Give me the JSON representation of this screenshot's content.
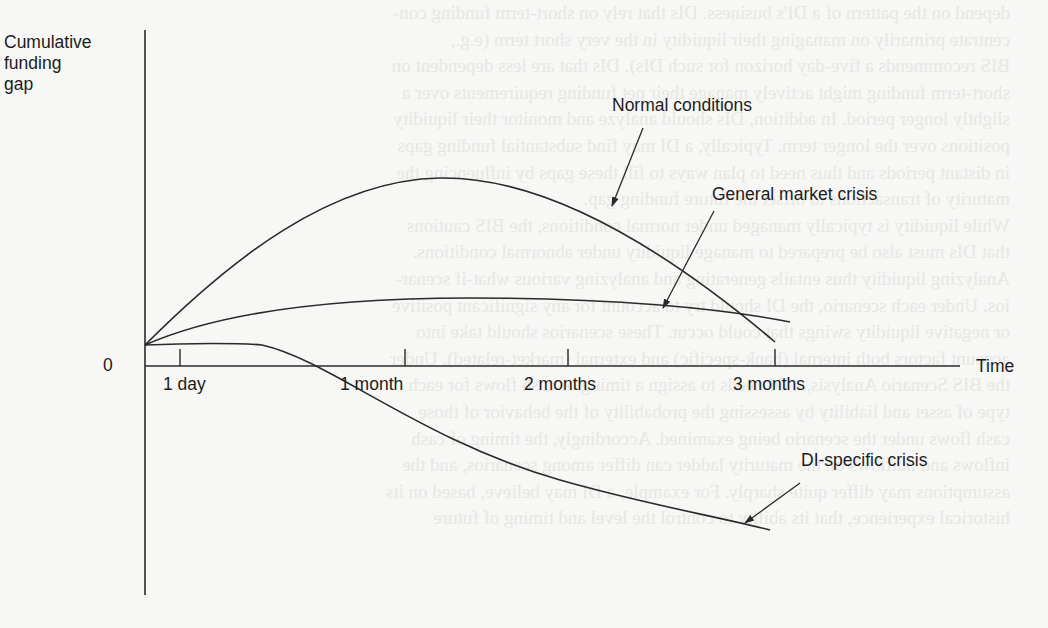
{
  "figure": {
    "y_axis_label": [
      "Cumulative",
      "funding",
      "gap"
    ],
    "x_axis_label": "Time",
    "origin_label": "0",
    "ticks": [
      {
        "label": "1 day",
        "x": 180,
        "label_x": 163
      },
      {
        "label": "1 month",
        "x": 405,
        "label_x": 340
      },
      {
        "label": "2 months",
        "x": 568,
        "label_x": 524
      },
      {
        "label": "3 months",
        "x": 775,
        "label_x": 733
      }
    ],
    "curves": [
      {
        "name": "Normal conditions",
        "label_x": 612,
        "label_y": 97,
        "path": "M145,345 C230,260 330,180 440,178 C560,176 690,270 775,342",
        "arrow": {
          "x1": 643,
          "y1": 128,
          "x2": 612,
          "y2": 206
        }
      },
      {
        "name": "General market crisis",
        "label_x": 712,
        "label_y": 186,
        "path": "M145,345 C220,312 330,298 470,298 C610,298 720,308 790,322",
        "arrow": {
          "x1": 714,
          "y1": 211,
          "x2": 663,
          "y2": 308
        }
      },
      {
        "name": "DI-specific crisis",
        "label_x": 801,
        "label_y": 452,
        "path": "M145,345 C190,343 240,343 262,345 C330,360 420,440 560,480 C640,503 710,515 770,530",
        "arrow": {
          "x1": 800,
          "y1": 483,
          "x2": 745,
          "y2": 523
        }
      }
    ],
    "colors": {
      "line": "#2a2a2a",
      "text": "#1c1c1c",
      "background": "#f7f7f5",
      "bleed_text": "#e6e6e3"
    }
  },
  "bleed_through_text": [
    "depend on the pattern of a DI's business. DIs that rely on short-term funding con-",
    "centrate primarily on managing their liquidity in the very short term (e.g.,",
    "BIS recommends a five-day horizon for such DIs). DIs that are less dependent on",
    "short-term funding might actively manage their net funding requirements over a",
    "slightly longer period. In addition, DIs should analyze and monitor their liquidity",
    "positions over the longer term. Typically, a DI may find substantial funding gaps",
    "in distant periods and thus need to plan ways to fill these gaps by influencing the",
    "maturity of transactions to offset the future funding gap.",
    "While liquidity is typically managed under normal conditions, the BIS cautions",
    "that DIs must also be prepared to manage liquidity under abnormal conditions.",
    "Analyzing liquidity thus entails generating and analyzing various what-if scenar-",
    "ios. Under each scenario, the DI should try to account for any significant positive",
    "or negative liquidity swings that could occur. These scenarios should take into",
    "account factors both internal (bank-specific) and external (market-related). Under",
    "the BIS Scenario Analysis, a DI needs to assign a timing of cash flows for each",
    "type of asset and liability by assessing the probability of the behavior of those",
    "cash flows under the scenario being examined. Accordingly, the timing of cash",
    "inflows and outflows on the maturity ladder can differ among scenarios, and the",
    "assumptions may differ quite sharply. For example, a DI may believe, based on its",
    "historical experience, that its ability to control the level and timing of future"
  ]
}
